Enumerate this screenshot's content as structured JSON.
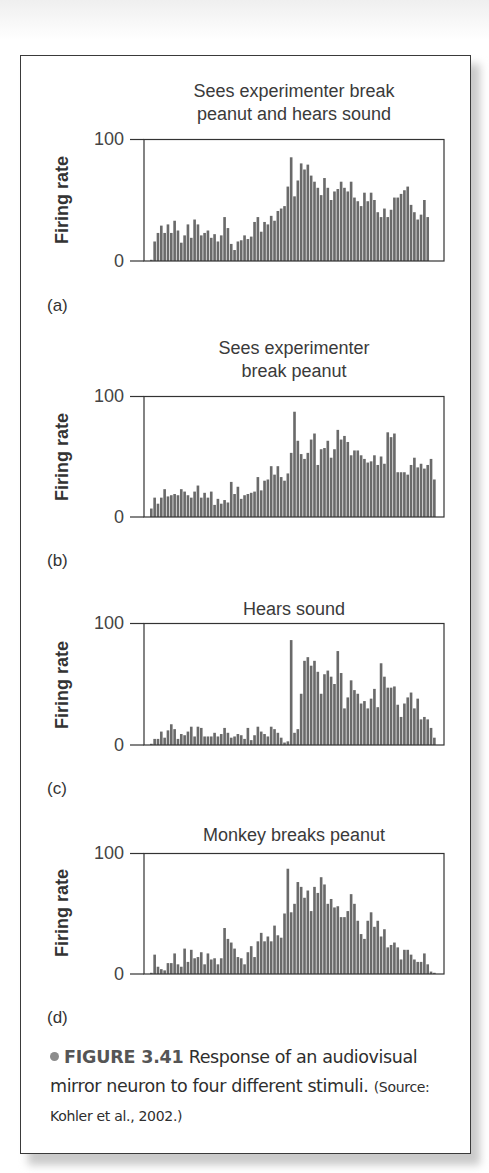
{
  "figure": {
    "number_label": "FIGURE 3.41",
    "caption_text": " Response of an audiovisual mirror neuron to four different stimuli.",
    "source": "(Source: Kohler et al., 2002.)"
  },
  "style": {
    "bar_color": "#6a6a6a",
    "axis_color": "#333333"
  },
  "chart_data": [
    {
      "panel": "(a)",
      "type": "bar",
      "title": "Sees experimenter break peanut and hears sound",
      "title_lines": [
        "Sees experimenter break",
        "peanut and hears sound"
      ],
      "xlabel": "",
      "ylabel": "Firing rate",
      "ylim": [
        0,
        100
      ],
      "yticks": [
        "100",
        "0"
      ],
      "grid": false,
      "values": [
        1,
        16,
        23,
        29,
        23,
        30,
        23,
        33,
        25,
        15,
        21,
        30,
        19,
        34,
        30,
        21,
        23,
        25,
        19,
        22,
        16,
        21,
        36,
        27,
        14,
        9,
        16,
        17,
        21,
        18,
        20,
        32,
        36,
        24,
        32,
        30,
        37,
        33,
        41,
        43,
        45,
        61,
        85,
        53,
        66,
        80,
        75,
        79,
        70,
        65,
        60,
        54,
        68,
        60,
        50,
        57,
        59,
        65,
        60,
        57,
        65,
        52,
        49,
        45,
        56,
        49,
        56,
        50,
        40,
        36,
        43,
        36,
        42,
        52,
        52,
        55,
        58,
        61,
        46,
        40,
        34,
        38,
        50,
        36
      ]
    },
    {
      "panel": "(b)",
      "type": "bar",
      "title": "Sees experimenter break peanut",
      "title_lines": [
        "Sees experimenter",
        "break peanut"
      ],
      "xlabel": "",
      "ylabel": "Firing rate",
      "ylim": [
        0,
        100
      ],
      "yticks": [
        "100",
        "0"
      ],
      "grid": false,
      "values": [
        7,
        16,
        11,
        16,
        23,
        17,
        18,
        19,
        18,
        23,
        21,
        18,
        16,
        21,
        26,
        16,
        20,
        16,
        21,
        10,
        15,
        11,
        14,
        12,
        29,
        19,
        25,
        15,
        18,
        19,
        20,
        21,
        33,
        22,
        30,
        31,
        42,
        35,
        42,
        33,
        30,
        36,
        53,
        87,
        63,
        52,
        48,
        53,
        64,
        69,
        43,
        56,
        57,
        63,
        49,
        56,
        72,
        64,
        67,
        62,
        51,
        55,
        55,
        51,
        48,
        45,
        46,
        51,
        43,
        50,
        44,
        70,
        66,
        69,
        37,
        37,
        37,
        35,
        43,
        49,
        41,
        44,
        40,
        43,
        48,
        31
      ]
    },
    {
      "panel": "(c)",
      "type": "bar",
      "title": "Hears sound",
      "title_lines": [
        "Hears sound"
      ],
      "xlabel": "",
      "ylabel": "Firing rate",
      "ylim": [
        0,
        100
      ],
      "yticks": [
        "100",
        "0"
      ],
      "grid": false,
      "values": [
        1,
        5,
        5,
        11,
        6,
        12,
        17,
        13,
        5,
        9,
        8,
        11,
        15,
        7,
        15,
        14,
        7,
        7,
        7,
        10,
        7,
        9,
        14,
        10,
        6,
        7,
        9,
        8,
        5,
        14,
        4,
        8,
        15,
        11,
        9,
        7,
        15,
        13,
        10,
        6,
        2,
        3,
        86,
        10,
        13,
        42,
        69,
        72,
        65,
        69,
        60,
        42,
        58,
        61,
        56,
        50,
        77,
        59,
        30,
        39,
        53,
        45,
        42,
        34,
        36,
        30,
        38,
        46,
        31,
        67,
        56,
        47,
        47,
        48,
        33,
        23,
        34,
        39,
        43,
        30,
        38,
        21,
        23,
        21,
        14,
        6
      ]
    },
    {
      "panel": "(d)",
      "type": "bar",
      "title": "Monkey breaks peanut",
      "title_lines": [
        "Monkey breaks peanut"
      ],
      "xlabel": "",
      "ylabel": "Firing rate",
      "ylim": [
        0,
        100
      ],
      "yticks": [
        "100",
        "0"
      ],
      "grid": false,
      "values": [
        1,
        16,
        6,
        4,
        3,
        9,
        9,
        17,
        8,
        6,
        21,
        10,
        20,
        13,
        14,
        18,
        8,
        17,
        12,
        13,
        8,
        13,
        38,
        29,
        26,
        21,
        14,
        13,
        8,
        18,
        23,
        14,
        27,
        34,
        27,
        31,
        27,
        40,
        32,
        30,
        50,
        87,
        51,
        58,
        76,
        72,
        63,
        69,
        52,
        72,
        67,
        80,
        74,
        58,
        62,
        55,
        56,
        47,
        47,
        52,
        66,
        58,
        44,
        33,
        29,
        44,
        51,
        39,
        44,
        31,
        37,
        22,
        24,
        26,
        22,
        12,
        20,
        20,
        16,
        12,
        10,
        10,
        17,
        8,
        2,
        1
      ]
    }
  ]
}
